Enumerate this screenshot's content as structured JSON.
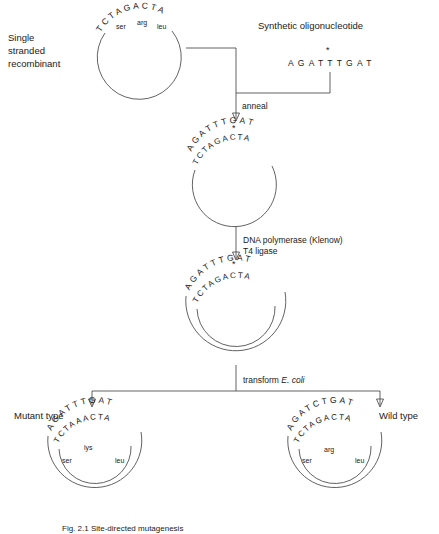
{
  "figure": {
    "title_caption": "Fig. 2.1  Site-directed mutagenesis",
    "panels": {
      "single_stranded": {
        "label": "Single\nstranded\nrecombinant",
        "label_line1": "Single",
        "label_line2": "stranded",
        "label_line3": "recombinant",
        "template_sequence": "TCTAGACTA",
        "codons": [
          "ser",
          "arg",
          "leu"
        ]
      },
      "oligo": {
        "label": "Synthetic oligonucleotide",
        "sequence": "AGATTTGAT",
        "mismatch_marker": "*",
        "mismatch_index": 4
      },
      "annealed": {
        "top_strand": "AGATTTGAT",
        "bottom_strand": "TCTAGACTA",
        "mismatch_marker": "*"
      },
      "extended": {
        "top_strand": "AGATTTGAT",
        "bottom_strand": "TCTAGACTA",
        "mismatch_marker": "*"
      },
      "mutant": {
        "label": "Mutant type",
        "outer_strand": "AGATTTGAT",
        "inner_strand": "TCTAAACTA",
        "codon_top": "lys",
        "codon_left": "ser",
        "codon_right": "leu"
      },
      "wild": {
        "label": "Wild type",
        "outer_strand": "AGATCTGAT",
        "inner_strand": "TCTAGACTA",
        "codon_top": "arg",
        "codon_left": "ser",
        "codon_right": "leu"
      }
    },
    "steps": {
      "anneal": "anneal",
      "polymerase_line1": "DNA polymerase (Klenow)",
      "polymerase_line2": "T4 ligase",
      "transform_prefix": "transform ",
      "transform_organism": "E. coli"
    },
    "colors": {
      "ink": "#1a1a1a",
      "line": "#3a3a3a",
      "background": "#ffffff"
    }
  }
}
